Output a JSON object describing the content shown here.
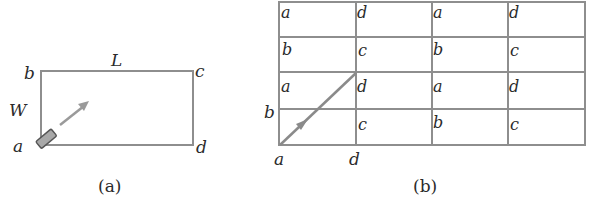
{
  "panel_a": {
    "caption": "(a)",
    "corners": {
      "a": "a",
      "b": "b",
      "c": "c",
      "d": "d"
    },
    "length_label": "L",
    "width_label": "W",
    "line_color": "#8e8e8e",
    "arrow_color": "#9a9a9a",
    "emitter_color": "#a8a8a8"
  },
  "panel_b": {
    "caption": "(b)",
    "grid": {
      "rows": 4,
      "cols": 4,
      "cells": [
        [
          "a",
          "d",
          "a",
          "d"
        ],
        [
          "b",
          "c",
          "b",
          "c"
        ],
        [
          "a",
          "d",
          "a",
          "d"
        ],
        [
          "",
          "c",
          "b",
          "c"
        ]
      ]
    },
    "outer_labels": {
      "left": "b",
      "bottom_left": "a",
      "bottom_mid": "d"
    },
    "line_color": "#8e8e8e",
    "arrow_color": "#8a8a8a"
  }
}
